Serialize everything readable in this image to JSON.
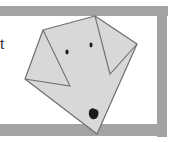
{
  "illustration": {
    "subject": "origami dog face drawing",
    "partial_text": "t",
    "colors": {
      "frame": "#9a9a9a",
      "frame_inner": "#ffffff",
      "paper": "#d9d9d9",
      "outline": "#6e6e6e",
      "eye": "#1a1a1a",
      "nose": "#1a1a1a"
    }
  }
}
